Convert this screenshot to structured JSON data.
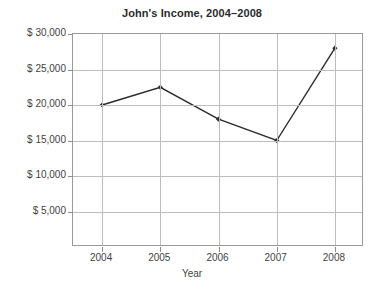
{
  "chart_data": {
    "type": "line",
    "title": "John's Income, 2004–2008",
    "xlabel": "Year",
    "ylabel": "",
    "categories": [
      "2004",
      "2005",
      "2006",
      "2007",
      "2008"
    ],
    "values": [
      20000,
      22500,
      18000,
      15000,
      28000
    ],
    "series": [
      {
        "name": "Income",
        "values": [
          20000,
          22500,
          18000,
          15000,
          28000
        ]
      }
    ],
    "ylim": [
      0,
      30000
    ],
    "ytick_values": [
      5000,
      10000,
      15000,
      20000,
      25000,
      30000
    ],
    "ytick_labels": [
      "$ 5,000",
      "$ 10,000",
      "$ 15,000",
      "$ 20,000",
      "$ 25,000",
      "$ 30,000"
    ],
    "xtick_labels": [
      "2004",
      "2005",
      "2006",
      "2007",
      "2008"
    ],
    "grid": true,
    "legend": "none",
    "marker": "diamond",
    "line_color": "#2b2b2b",
    "grid_color": "#bdbdbd",
    "axis_color": "#9a9a9a",
    "text_color": "#3f3f3f",
    "background_color": "#ffffff"
  }
}
